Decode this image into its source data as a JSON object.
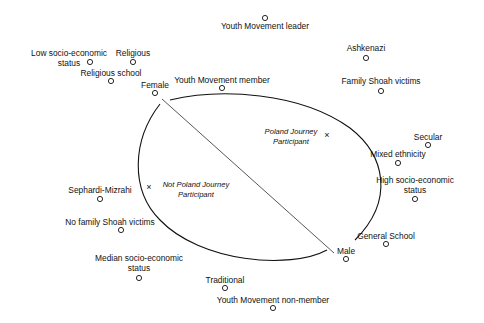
{
  "diagram": {
    "type": "correspondence-map",
    "colors": {
      "ink": "#111111",
      "background": "#ffffff",
      "divider": "#444444"
    },
    "points": [
      {
        "id": "youth-movement-leader",
        "lines": [
          "Youth Movement leader"
        ]
      },
      {
        "id": "ashkenazi",
        "lines": [
          "Ashkenazi"
        ]
      },
      {
        "id": "family-shoah-victims",
        "lines": [
          "Family Shoah victims"
        ]
      },
      {
        "id": "low-socio-economic-status",
        "lines": [
          "Low socio-economic",
          "status"
        ]
      },
      {
        "id": "religious",
        "lines": [
          "Religious"
        ]
      },
      {
        "id": "religious-school",
        "lines": [
          "Religious school"
        ]
      },
      {
        "id": "female",
        "lines": [
          "Female"
        ]
      },
      {
        "id": "youth-movement-member",
        "lines": [
          "Youth Movement member"
        ]
      },
      {
        "id": "secular",
        "lines": [
          "Secular"
        ]
      },
      {
        "id": "mixed-ethnicity",
        "lines": [
          "Mixed ethnicity"
        ]
      },
      {
        "id": "high-socio-economic-status",
        "lines": [
          "High socio-economic",
          "status"
        ]
      },
      {
        "id": "sephardi-mizrahi",
        "lines": [
          "Sephardi-Mizrahi"
        ]
      },
      {
        "id": "no-family-shoah-victims",
        "lines": [
          "No family Shoah victims"
        ]
      },
      {
        "id": "general-school",
        "lines": [
          "General School"
        ]
      },
      {
        "id": "male",
        "lines": [
          "Male"
        ]
      },
      {
        "id": "median-socio-economic-status",
        "lines": [
          "Median socio-economic",
          "status"
        ]
      },
      {
        "id": "traditional",
        "lines": [
          "Traditional"
        ]
      },
      {
        "id": "youth-movement-non-member",
        "lines": [
          "Youth Movement non-member"
        ]
      }
    ],
    "groups": [
      {
        "id": "poland-journey-participant",
        "marker": "x",
        "lines": [
          "Poland Journey",
          "Participant"
        ]
      },
      {
        "id": "not-poland-journey-participant",
        "marker": "x",
        "lines": [
          "Not Poland Journey",
          "Participant"
        ]
      }
    ]
  }
}
